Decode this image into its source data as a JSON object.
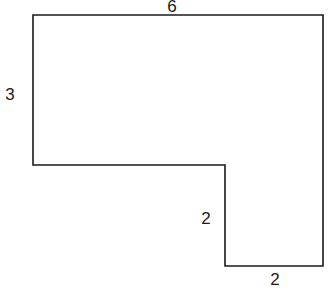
{
  "diagram": {
    "shape": "L-shaped polygon",
    "labels": {
      "top": "6",
      "left": "3",
      "inner_vertical": "2",
      "bottom": "2"
    },
    "dimensions": {
      "top_width": 6,
      "left_height": 3,
      "inner_vertical_height": 2,
      "bottom_width": 2
    },
    "stroke_color": "#1a1a1a",
    "background_color": "#ffffff"
  }
}
